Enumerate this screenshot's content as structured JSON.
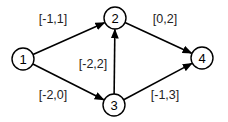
{
  "diagram": {
    "type": "directed-graph",
    "nodes": [
      {
        "id": "1",
        "label": "1",
        "x": 23,
        "y": 59
      },
      {
        "id": "2",
        "label": "2",
        "x": 115,
        "y": 18
      },
      {
        "id": "3",
        "label": "3",
        "x": 114,
        "y": 105
      },
      {
        "id": "4",
        "label": "4",
        "x": 202,
        "y": 58
      }
    ],
    "node_radius": 11,
    "edges": [
      {
        "from": "1",
        "to": "2",
        "label": "[-1,1]",
        "label_x": 53,
        "label_y": 19
      },
      {
        "from": "1",
        "to": "3",
        "label": "[-2,0]",
        "label_x": 53,
        "label_y": 95
      },
      {
        "from": "3",
        "to": "2",
        "label": "[-2,2]",
        "label_x": 93,
        "label_y": 64
      },
      {
        "from": "2",
        "to": "4",
        "label": "[0,2]",
        "label_x": 165,
        "label_y": 19
      },
      {
        "from": "3",
        "to": "4",
        "label": "[-1,3]",
        "label_x": 165,
        "label_y": 95
      }
    ],
    "colors": {
      "stroke": "#000000",
      "fill": "#ffffff",
      "text": "#000000"
    }
  }
}
